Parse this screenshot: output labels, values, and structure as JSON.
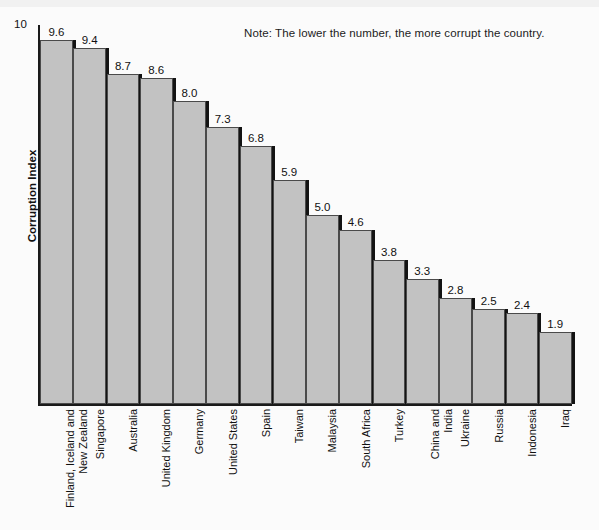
{
  "note": "Note: The lower the number, the more corrupt the country.",
  "axes": {
    "y_title": "Corruption Index",
    "y_top_tick": "10"
  },
  "colors": {
    "bar_fill": "#c2c2c2",
    "bar_border": "#4a4a4a",
    "bar_shadow": "#131313",
    "axis": "#1a1a1a",
    "background": "#fbfbfb",
    "text": "#111111"
  },
  "chart_data": {
    "type": "bar",
    "title": "",
    "subtitle": "",
    "xlabel": "",
    "ylabel": "Corruption Index",
    "ylim": [
      0,
      10
    ],
    "grid": false,
    "legend": false,
    "annotations": [
      "Note: The lower the number, the more corrupt the country."
    ],
    "ytick_labels": [
      "10"
    ],
    "categories": [
      "Finland, Iceland and New Zealand",
      "Singapore",
      "Australia",
      "United Kingdom",
      "Germany",
      "United States",
      "Spain",
      "Taiwan",
      "Malaysia",
      "South Africa",
      "Turkey",
      "China and India",
      "Ukraine",
      "Russia",
      "Indonesia",
      "Iraq"
    ],
    "category_lines": [
      [
        "Finland, Iceland and",
        "New Zealand"
      ],
      [
        "Singapore"
      ],
      [
        "Australia"
      ],
      [
        "United Kingdom"
      ],
      [
        "Germany"
      ],
      [
        "United States"
      ],
      [
        "Spain"
      ],
      [
        "Taiwan"
      ],
      [
        "Malaysia"
      ],
      [
        "South Africa"
      ],
      [
        "Turkey"
      ],
      [
        "China and",
        "India"
      ],
      [
        "Ukraine"
      ],
      [
        "Russia"
      ],
      [
        "Indonesia"
      ],
      [
        "Iraq"
      ]
    ],
    "values": [
      9.6,
      9.4,
      8.7,
      8.6,
      8.0,
      7.3,
      6.8,
      5.9,
      5.0,
      4.6,
      3.8,
      3.3,
      2.8,
      2.5,
      2.4,
      1.9
    ],
    "value_labels": [
      "9.6",
      "9.4",
      "8.7",
      "8.6",
      "8.0",
      "7.3",
      "6.8",
      "5.9",
      "5.0",
      "4.6",
      "3.8",
      "3.3",
      "2.8",
      "2.5",
      "2.4",
      "1.9"
    ]
  }
}
